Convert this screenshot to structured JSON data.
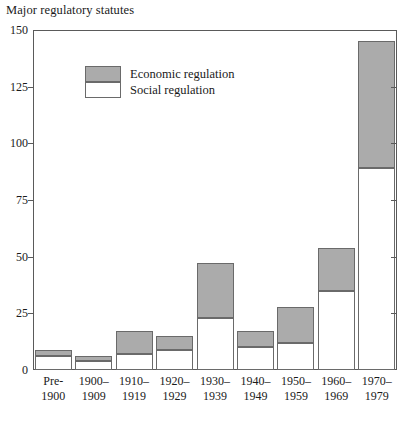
{
  "chart_data": {
    "type": "bar",
    "subtype": "stacked-vertical",
    "title": "Major regulatory statutes",
    "xlabel": "",
    "ylabel": "",
    "ylim": [
      0,
      150
    ],
    "yticks": [
      0,
      25,
      50,
      75,
      100,
      125,
      150
    ],
    "ytick_labels": [
      "0",
      "25",
      "50",
      "75",
      "100",
      "125",
      "150"
    ],
    "grid": false,
    "legend_position": "upper-left-inside",
    "categories": [
      "Pre-\n1900",
      "1900–\n1909",
      "1910–\n1919",
      "1920–\n1929",
      "1930–\n1939",
      "1940–\n1949",
      "1950–\n1959",
      "1960–\n1969",
      "1970–\n1979"
    ],
    "category_lines": [
      [
        "Pre-",
        "1900"
      ],
      [
        "1900–",
        "1909"
      ],
      [
        "1910–",
        "1919"
      ],
      [
        "1920–",
        "1929"
      ],
      [
        "1930–",
        "1939"
      ],
      [
        "1940–",
        "1949"
      ],
      [
        "1950–",
        "1959"
      ],
      [
        "1960–",
        "1969"
      ],
      [
        "1970–",
        "1979"
      ]
    ],
    "series": [
      {
        "name": "Social regulation",
        "color": "#ffffff",
        "values": [
          6,
          4,
          7,
          9,
          23,
          10,
          12,
          35,
          89
        ]
      },
      {
        "name": "Economic regulation",
        "color": "#ababab",
        "values": [
          3,
          2,
          10,
          6,
          24,
          7,
          16,
          19,
          56
        ]
      }
    ],
    "totals": [
      9,
      6,
      17,
      15,
      47,
      17,
      28,
      54,
      145
    ]
  },
  "legend": {
    "items": [
      {
        "label": "Economic regulation",
        "swatch": "economic"
      },
      {
        "label": "Social regulation",
        "swatch": "social"
      }
    ]
  },
  "colors": {
    "economic": "#ababab",
    "social": "#ffffff",
    "axis": "#5a5a5a",
    "bar_outline": "#6a6a6a",
    "text": "#1a1a1a"
  }
}
